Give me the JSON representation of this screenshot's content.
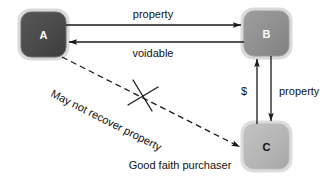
{
  "diagram": {
    "nodes": [
      {
        "id": "A",
        "label": "A",
        "fill": "#4a4a4a",
        "text_color": "#ffffff",
        "x": 21,
        "y": 12,
        "w": 45,
        "h": 45
      },
      {
        "id": "B",
        "label": "B",
        "fill": "#8f8f8f",
        "text_color": "#ffffff",
        "x": 244,
        "y": 11,
        "w": 45,
        "h": 45
      },
      {
        "id": "C",
        "label": "C",
        "fill": "#b5b5b5",
        "text_color": "#111111",
        "x": 244,
        "y": 124,
        "w": 45,
        "h": 45
      }
    ],
    "edges": [
      {
        "id": "a-to-b",
        "label": "property",
        "from": "A",
        "to": "B",
        "style": "solid"
      },
      {
        "id": "b-to-a",
        "label": "voidable",
        "from": "B",
        "to": "A",
        "style": "solid"
      },
      {
        "id": "c-to-b",
        "label": "$",
        "from": "C",
        "to": "B",
        "style": "solid"
      },
      {
        "id": "b-to-c",
        "label": "property",
        "from": "B",
        "to": "C",
        "style": "solid"
      },
      {
        "id": "a-to-c-blocked",
        "label": "May not recover property",
        "from": "A",
        "to": "C",
        "style": "dashed",
        "blocked": true
      }
    ],
    "caption": "Good faith purchaser",
    "colors": {
      "stroke": "#1a1a1a",
      "box_border": "#c9c9c9",
      "background": "#ffffff"
    }
  }
}
